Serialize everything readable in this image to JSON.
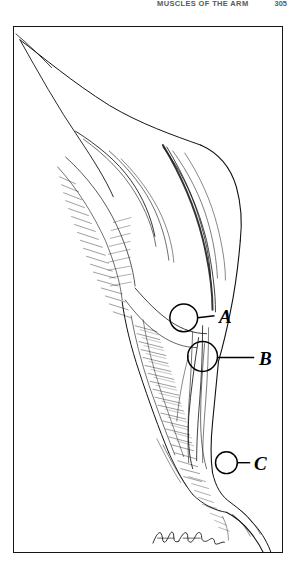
{
  "page": {
    "header_title": "MUSCLES OF THE ARM",
    "page_number": "305",
    "background_color": "#ffffff",
    "ink_color": "#000000"
  },
  "figure": {
    "caption_absent": true,
    "frame": {
      "border_color": "#151515",
      "border_width_px": 1.6,
      "x": 13,
      "y": 26,
      "width": 270,
      "height": 527
    },
    "style": "pen-and-ink stipple and hatch medical illustration",
    "signature": {
      "present": true,
      "name": "artist-signature",
      "x": 150,
      "y": 513
    },
    "markers": [
      {
        "label": "A",
        "name": "marker-a",
        "circle": {
          "cx": 171,
          "cy": 292,
          "r": 14
        },
        "leader": {
          "x1": 185,
          "y1": 292,
          "x2": 202,
          "y2": 290
        },
        "label_x": 205,
        "label_y": 280
      },
      {
        "label": "B",
        "name": "marker-b",
        "circle": {
          "cx": 190,
          "cy": 331,
          "r": 15
        },
        "leader": {
          "x1": 205,
          "y1": 332,
          "x2": 242,
          "y2": 332
        },
        "label_x": 245,
        "label_y": 322
      },
      {
        "label": "C",
        "name": "marker-c",
        "circle": {
          "cx": 214,
          "cy": 438,
          "r": 11
        },
        "leader": {
          "x1": 225,
          "y1": 438,
          "x2": 238,
          "y2": 438
        },
        "label_x": 240,
        "label_y": 427
      }
    ]
  }
}
